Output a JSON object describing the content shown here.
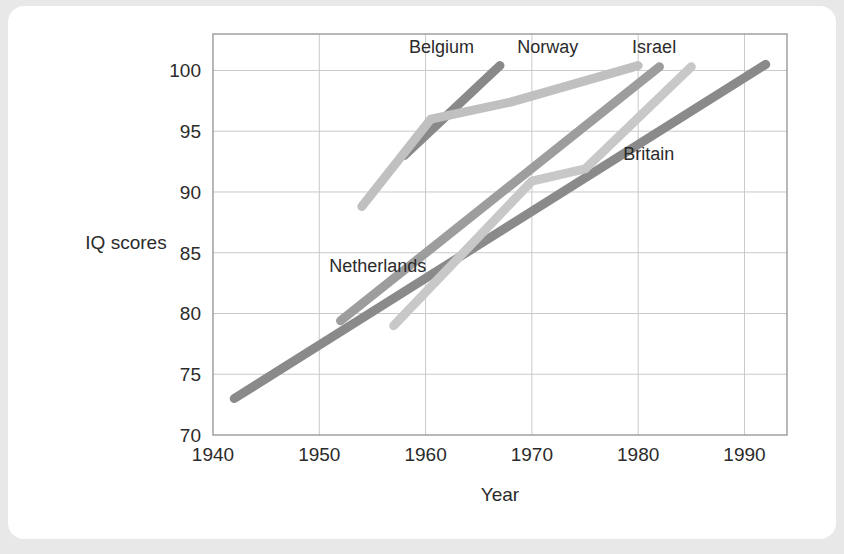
{
  "card": {
    "background_color": "#ffffff",
    "page_background_color": "#e8e8e8"
  },
  "chart_data": {
    "type": "line",
    "title": "",
    "xlabel": "Year",
    "ylabel": "IQ scores",
    "xlim": [
      1940,
      1994
    ],
    "ylim": [
      70,
      103
    ],
    "xticks": [
      1940,
      1950,
      1960,
      1970,
      1980,
      1990
    ],
    "yticks": [
      70,
      75,
      80,
      85,
      90,
      95,
      100
    ],
    "xtick_labels": [
      "1940",
      "1950",
      "1960",
      "1970",
      "1980",
      "1990"
    ],
    "ytick_labels": [
      "70",
      "75",
      "80",
      "85",
      "90",
      "95",
      "100"
    ],
    "grid": true,
    "legend": "inline-labels",
    "series": [
      {
        "name": "Britain",
        "color": "#8a8a8a",
        "label_x": 1981,
        "label_y": 92.6,
        "points": [
          [
            1942,
            73.0
          ],
          [
            1992,
            100.5
          ]
        ]
      },
      {
        "name": "Netherlands",
        "color": "#9d9d9d",
        "label_x": 1955.5,
        "label_y": 83.4,
        "points": [
          [
            1952,
            79.4
          ],
          [
            1982,
            100.3
          ]
        ]
      },
      {
        "name": "Belgium",
        "color": "#898989",
        "label_x": 1961.5,
        "label_y": 101.4,
        "points": [
          [
            1958,
            93.0
          ],
          [
            1967,
            100.4
          ]
        ]
      },
      {
        "name": "Norway",
        "color": "#c0c0c0",
        "label_x": 1971.5,
        "label_y": 101.4,
        "points": [
          [
            1954,
            88.8
          ],
          [
            1960.5,
            96.0
          ],
          [
            1968,
            97.4
          ],
          [
            1980,
            100.4
          ]
        ]
      },
      {
        "name": "Israel",
        "color": "#c8c8c8",
        "label_x": 1981.5,
        "label_y": 101.4,
        "points": [
          [
            1957,
            79.0
          ],
          [
            1970,
            90.9
          ],
          [
            1975,
            91.9
          ],
          [
            1985,
            100.3
          ]
        ]
      }
    ]
  }
}
